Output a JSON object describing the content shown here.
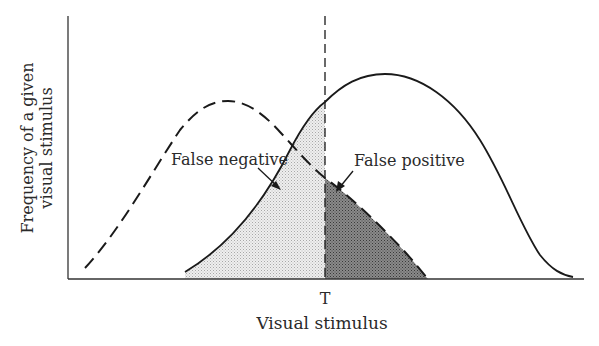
{
  "figure": {
    "y_axis_label_line1": "Frequency of a given",
    "y_axis_label_line2": "visual stimulus",
    "x_axis_label": "Visual stimulus",
    "threshold_label": "T",
    "annotations": {
      "false_negative": "False negative",
      "false_positive": "False positive"
    },
    "curves": [
      {
        "name": "noise-distribution",
        "style": "dashed"
      },
      {
        "name": "signal-distribution",
        "style": "solid"
      }
    ],
    "regions": [
      {
        "name": "false-negative-region",
        "fill": "#e6e6e6"
      },
      {
        "name": "false-positive-region",
        "fill": "#6e6e6e"
      }
    ],
    "colors": {
      "line": "#1a1a1a",
      "axis": "#333333"
    }
  }
}
